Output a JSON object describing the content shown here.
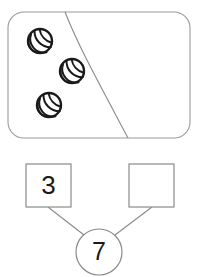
{
  "page": {
    "background_color": "#ffffff",
    "ink_color": "#808080",
    "text_color": "#1a1a1a",
    "marble_color": "#1a1a1a"
  },
  "marble_group": {
    "label": "marble-group-panel",
    "panel": {
      "x": 8,
      "y": 12,
      "width": 182,
      "height": 126,
      "corner_radius": 16,
      "stroke": "#9a9a9a",
      "fill": "#ffffff"
    },
    "divider": {
      "name": "curved-divider",
      "path": "M 65 12 C 78 45, 96 78, 128 138",
      "stroke": "#8a8a8a"
    },
    "marbles": [
      {
        "name": "marble-1",
        "cx": 40,
        "cy": 41,
        "r": 12
      },
      {
        "name": "marble-2",
        "cx": 72,
        "cy": 71,
        "r": 12
      },
      {
        "name": "marble-3",
        "cx": 49,
        "cy": 105,
        "r": 12
      }
    ],
    "marble_count": 3
  },
  "number_bond": {
    "label": "number-bond",
    "left_box": {
      "name": "part-box-left",
      "value": "3",
      "filled": true,
      "x": 26,
      "y": 164,
      "width": 45,
      "height": 43
    },
    "right_box": {
      "name": "part-box-right",
      "value": "",
      "filled": false,
      "x": 129,
      "y": 164,
      "width": 45,
      "height": 43
    },
    "total_circle": {
      "name": "total-circle",
      "value": "7",
      "cx": 99,
      "cy": 252,
      "r": 23
    },
    "connectors": [
      {
        "name": "connector-left",
        "x1": 48,
        "y1": 207,
        "x2": 84,
        "y2": 235
      },
      {
        "name": "connector-right",
        "x1": 152,
        "y1": 207,
        "x2": 115,
        "y2": 235
      }
    ],
    "stroke": "#8a8a8a"
  }
}
